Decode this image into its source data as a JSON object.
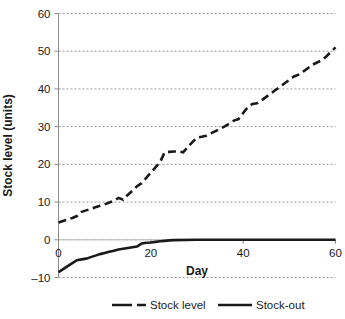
{
  "chart_data": {
    "type": "line",
    "title": "",
    "xlabel": "Day",
    "ylabel": "Stock level (units)",
    "xlim": [
      0,
      60
    ],
    "ylim": [
      -10,
      60
    ],
    "xticks": [
      0,
      20,
      40,
      60
    ],
    "yticks": [
      -10,
      0,
      10,
      20,
      30,
      40,
      50,
      60
    ],
    "xtick_labels": [
      "0",
      "20",
      "40",
      "60"
    ],
    "ytick_labels": [
      "–10",
      "0",
      "10",
      "20",
      "30",
      "40",
      "50",
      "60"
    ],
    "grid": "horizontal-dotted",
    "legend_position": "bottom",
    "colors": {
      "series": "#1a1a1a",
      "grid": "#9a9a9a",
      "axis": "#8c8c8c",
      "zero_line": "#bdbdbd",
      "background": "#ffffff"
    },
    "series": [
      {
        "name": "Stock level",
        "style": "dashed",
        "x": [
          0,
          1,
          2,
          3,
          4,
          5,
          6,
          7,
          8,
          9,
          10,
          11,
          12,
          13,
          14,
          15,
          16,
          17,
          18,
          19,
          20,
          21,
          22,
          23,
          24,
          25,
          26,
          27,
          28,
          29,
          30,
          31,
          32,
          33,
          34,
          35,
          36,
          37,
          38,
          39,
          40,
          41,
          42,
          43,
          44,
          45,
          46,
          47,
          48,
          49,
          50,
          51,
          52,
          53,
          54,
          55,
          56,
          57,
          58,
          59,
          60
        ],
        "values": [
          4.6,
          5.0,
          5.4,
          5.8,
          6.3,
          7.4,
          7.8,
          8.2,
          8.6,
          9.0,
          9.4,
          9.9,
          10.3,
          11.1,
          10.6,
          11.9,
          13.0,
          14.2,
          15.0,
          16.4,
          17.8,
          19.2,
          20.6,
          23.2,
          23.3,
          23.4,
          23.4,
          23.2,
          24.6,
          25.9,
          27.1,
          27.3,
          27.6,
          28.2,
          28.8,
          29.4,
          30.1,
          30.8,
          31.6,
          32.0,
          33.6,
          35.2,
          36.0,
          36.2,
          37.0,
          37.9,
          38.8,
          39.7,
          40.6,
          41.5,
          42.4,
          43.3,
          43.8,
          44.6,
          45.5,
          46.4,
          47.0,
          47.6,
          48.6,
          49.8,
          51.0
        ]
      },
      {
        "name": "Stock-out",
        "style": "solid",
        "x": [
          0,
          1,
          2,
          3,
          4,
          5,
          6,
          7,
          8,
          9,
          10,
          11,
          12,
          13,
          14,
          15,
          16,
          17,
          18,
          19,
          20,
          21,
          22,
          23,
          24,
          25,
          30,
          35,
          40,
          45,
          50,
          55,
          60
        ],
        "values": [
          -8.6,
          -7.8,
          -7.0,
          -6.2,
          -5.4,
          -5.2,
          -5.0,
          -4.6,
          -4.2,
          -3.8,
          -3.5,
          -3.2,
          -2.9,
          -2.6,
          -2.4,
          -2.2,
          -2.0,
          -1.8,
          -1.0,
          -0.8,
          -0.7,
          -0.55,
          -0.4,
          -0.28,
          -0.15,
          -0.08,
          0.0,
          0.0,
          0.0,
          0.0,
          0.0,
          0.0,
          0.0
        ]
      }
    ]
  },
  "legend": {
    "items": [
      {
        "label": "Stock level",
        "style": "dashed"
      },
      {
        "label": "Stock-out",
        "style": "solid"
      }
    ]
  }
}
